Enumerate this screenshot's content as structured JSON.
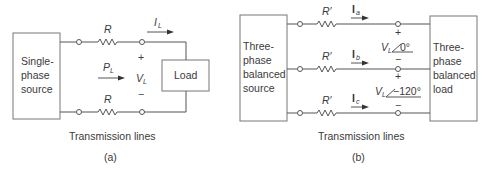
{
  "diagram_a": {
    "source_label": [
      "Single-",
      "phase",
      "source"
    ],
    "load_label": "Load",
    "resistor_top": "R",
    "resistor_bottom": "R",
    "current_label": "I",
    "current_sub": "L",
    "power_label": "P",
    "power_sub": "L",
    "voltage_label": "V",
    "voltage_sub": "L",
    "plus": "+",
    "minus": "−",
    "caption": "Transmission lines",
    "sub_caption": "(a)"
  },
  "diagram_b": {
    "source_label": [
      "Three-",
      "phase",
      "balanced",
      "source"
    ],
    "load_label": [
      "Three-",
      "phase",
      "balanced",
      "load"
    ],
    "resistors": [
      "R′",
      "R′",
      "R′"
    ],
    "currents": [
      {
        "label": "I",
        "sub": "a"
      },
      {
        "label": "I",
        "sub": "b"
      },
      {
        "label": "I",
        "sub": "c"
      }
    ],
    "voltage_ab": {
      "label": "V",
      "sub": "L",
      "angle": "0°"
    },
    "voltage_bc": {
      "label": "V",
      "sub": "L",
      "angle": "−120°"
    },
    "plus": "+",
    "minus": "−",
    "caption": "Transmission lines",
    "sub_caption": "(b)"
  },
  "colors": {
    "line": "#4a4a4a",
    "text": "#3a3a3a",
    "box_border": "#7a7a7a"
  }
}
